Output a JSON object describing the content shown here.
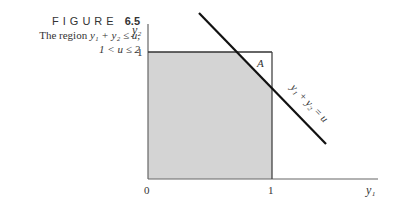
{
  "caption": {
    "figure_word": "FIGURE",
    "figure_number": "6.5",
    "line1_prefix": "The region",
    "line1_math": "y₁ + y₂ ≤ u,",
    "line2_math": "1 < u ≤ 2"
  },
  "diagram": {
    "y_axis_label": "y₂",
    "x_axis_label": "y₁",
    "origin_label": "0",
    "x_tick_label": "1",
    "y_tick_label": "1",
    "region_label": "A",
    "line_label": "y₁ + y₂ = u",
    "shade_color": "#d4d4d4",
    "line_color": "#111111"
  }
}
